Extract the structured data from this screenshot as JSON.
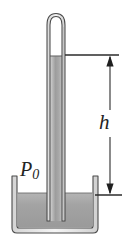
{
  "figure": {
    "type": "mercury-barometer-diagram",
    "caption": "",
    "background_color": "#ffffff",
    "width": 132,
    "height": 242
  },
  "labels": {
    "height_symbol": "h",
    "pressure_symbol": "P",
    "pressure_subscript": "0"
  },
  "colors": {
    "outline": "#3d3d3d",
    "mercury_light": "#cfcfcf",
    "mercury_mid": "#a8a8a8",
    "mercury_dark": "#8f8f8f",
    "glass_light": "#f2f2f2",
    "glass_shadow": "#bdbdbd",
    "vacuum_fill": "#ffffff",
    "dimension_line": "#2b2b2b",
    "label_color": "#232323"
  },
  "geometry": {
    "tube": {
      "left": 47,
      "right": 65,
      "top": 16,
      "bottom": 221,
      "wall_thickness": 3,
      "cap_radius": 9
    },
    "mercury_column": {
      "top": 56,
      "bottom": 221
    },
    "vacuum_space": {
      "top": 16,
      "bottom": 56
    },
    "basin": {
      "left": 12,
      "right": 98,
      "top": 176,
      "bottom": 233,
      "wall_thickness": 4
    },
    "basin_mercury_level": 193,
    "dimension": {
      "top_line_y": 55,
      "top_line_x1": 65,
      "top_line_x2": 119,
      "bottom_line_y": 195,
      "bottom_line_x1": 95,
      "bottom_line_x2": 122,
      "arrow_x": 110,
      "arrow_top_y": 57,
      "arrow_bottom_y": 193
    }
  }
}
